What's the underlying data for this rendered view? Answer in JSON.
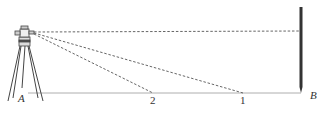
{
  "diagram": {
    "labels": {
      "station": "A",
      "rod_point": "B",
      "point_1": "1",
      "point_2": "2"
    },
    "elements": {
      "instrument": "theodolite-on-tripod",
      "rod": "vertical-leveling-rod",
      "ground_line": "horizontal line A–B",
      "sight_lines": [
        "horizontal to rod at B",
        "to point 1",
        "to point 2"
      ]
    },
    "colors": {
      "line": "#555555",
      "ground": "#9a9a9a",
      "rod": "#333333"
    }
  }
}
